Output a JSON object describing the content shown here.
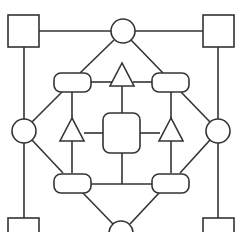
{
  "diagram": {
    "title": "",
    "colors": {
      "stroke": "#333333",
      "fill": "#ffffff",
      "background": "#ffffff"
    },
    "nodes": [
      {
        "id": "sq-tl",
        "shape": "square"
      },
      {
        "id": "sq-tr",
        "shape": "square"
      },
      {
        "id": "sq-bl",
        "shape": "square"
      },
      {
        "id": "sq-br",
        "shape": "square"
      },
      {
        "id": "c-top",
        "shape": "circle"
      },
      {
        "id": "c-left",
        "shape": "circle"
      },
      {
        "id": "c-right",
        "shape": "circle"
      },
      {
        "id": "c-bottom",
        "shape": "circle"
      },
      {
        "id": "rr-tl",
        "shape": "rounded-rect"
      },
      {
        "id": "rr-tr",
        "shape": "rounded-rect"
      },
      {
        "id": "rr-bl",
        "shape": "rounded-rect"
      },
      {
        "id": "rr-br",
        "shape": "rounded-rect"
      },
      {
        "id": "center",
        "shape": "rounded-square"
      },
      {
        "id": "t-top",
        "shape": "triangle"
      },
      {
        "id": "t-left",
        "shape": "triangle"
      },
      {
        "id": "t-right",
        "shape": "triangle"
      }
    ],
    "edges": [
      [
        "sq-tl",
        "c-top"
      ],
      [
        "c-top",
        "sq-tr"
      ],
      [
        "sq-tl",
        "c-left"
      ],
      [
        "sq-tr",
        "c-right"
      ],
      [
        "c-left",
        "sq-bl"
      ],
      [
        "c-right",
        "sq-br"
      ],
      [
        "c-top",
        "rr-tl"
      ],
      [
        "c-top",
        "rr-tr"
      ],
      [
        "c-left",
        "rr-tl"
      ],
      [
        "c-right",
        "rr-tr"
      ],
      [
        "c-left",
        "rr-bl"
      ],
      [
        "c-right",
        "rr-br"
      ],
      [
        "c-bottom",
        "rr-bl"
      ],
      [
        "c-bottom",
        "rr-br"
      ],
      [
        "rr-tl",
        "t-top"
      ],
      [
        "t-top",
        "rr-tr"
      ],
      [
        "rr-tl",
        "t-left"
      ],
      [
        "t-left",
        "rr-bl"
      ],
      [
        "rr-tr",
        "t-right"
      ],
      [
        "t-right",
        "rr-br"
      ],
      [
        "t-top",
        "center"
      ],
      [
        "t-left",
        "center"
      ],
      [
        "center",
        "t-right"
      ],
      [
        "center",
        "bottom-junction"
      ],
      [
        "rr-bl",
        "rr-br"
      ]
    ]
  }
}
